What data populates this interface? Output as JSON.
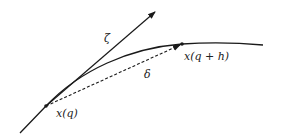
{
  "diagram": {
    "labels": {
      "zeta": "ζ",
      "delta": "δ",
      "start_point": "x(q)",
      "end_point": "x(q + h)"
    },
    "colors": {
      "stroke": "#1a1a1a",
      "text": "#222222",
      "background": "#ffffff"
    },
    "elements": {
      "curve": "smooth trajectory x(·)",
      "tangent": "tangent vector ζ at x(q)",
      "chord": "dashed chord δ from x(q) to x(q + h)"
    }
  }
}
